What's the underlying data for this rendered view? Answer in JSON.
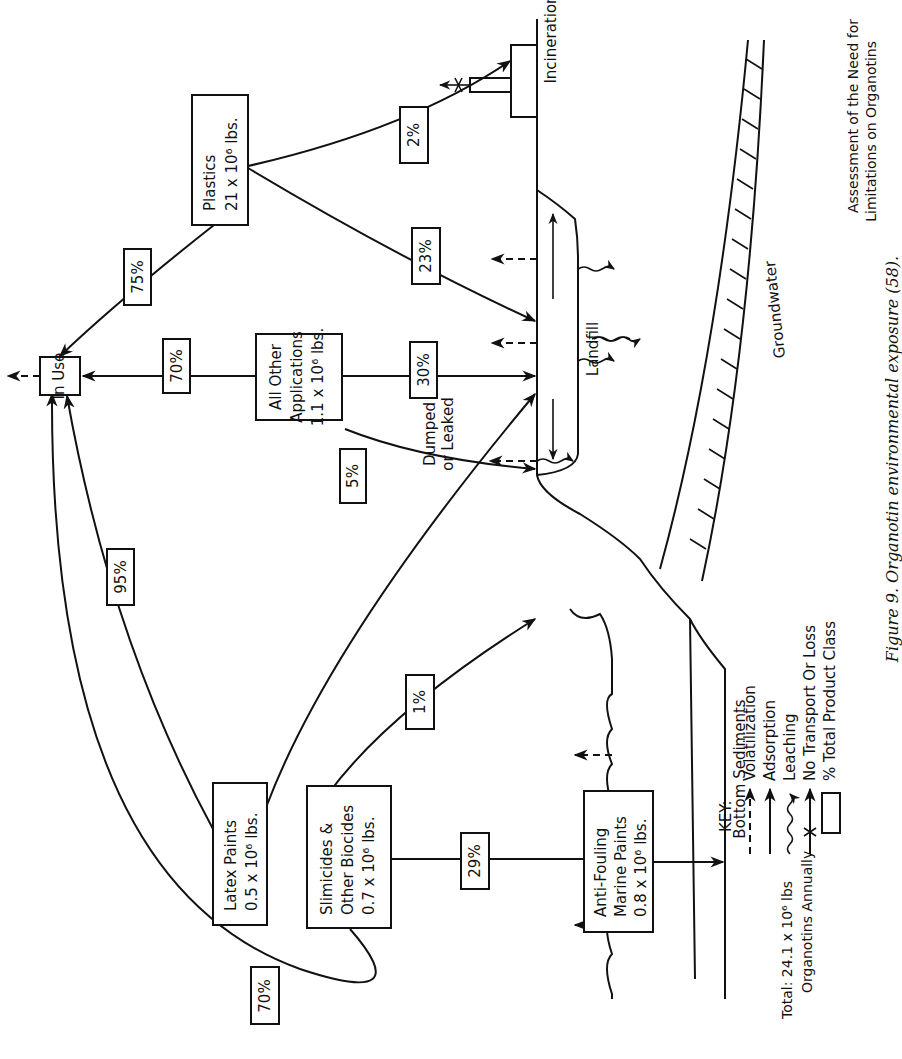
{
  "nodes": {
    "in_use": {
      "label": "In Use"
    },
    "plastics": {
      "line1": "Plastics",
      "line2": "21 x 10⁶ lbs."
    },
    "all_other": {
      "line1": "All Other",
      "line2": "Applications",
      "line3": "1.1 x 10⁶ lbs."
    },
    "latex": {
      "line1": "Latex Paints",
      "line2": "0.5 x 10⁶ lbs."
    },
    "slimicides": {
      "line1": "Slimicides &",
      "line2": "Other Biocides",
      "line3": "0.7 x 10⁶ lbs."
    },
    "antifouling": {
      "line1": "Anti-Fouling",
      "line2": "Marine Paints",
      "line3": "0.8 x 10⁶ lbs."
    }
  },
  "flows": {
    "plastics_to_in_use": "75%",
    "plastics_to_incineration": "2%",
    "plastics_to_landfill": "23%",
    "all_other_to_in_use": "70%",
    "all_other_to_landfill": "30%",
    "latex_to_in_use": "95%",
    "latex_to_dumped": "5%",
    "slimicides_to_in_use": "70%",
    "slimicides_to_dumped": "1%",
    "slimicides_to_water": "29%"
  },
  "places": {
    "incineration": "Incineration",
    "landfill": "Landfill",
    "groundwater": "Groundwater",
    "dumped_line1": "Dumped",
    "dumped_line2": "or Leaked",
    "bottom_sediments": "Bottom Sediments"
  },
  "key": {
    "title": "KEY:",
    "items": [
      {
        "icon": "dashed-arrow",
        "label": "Volatilization"
      },
      {
        "icon": "solid-arrow",
        "label": "Adsorption"
      },
      {
        "icon": "wavy-arrow",
        "label": "Leaching"
      },
      {
        "icon": "crossed-arrow",
        "label": "No Transport Or Loss"
      },
      {
        "icon": "box",
        "label": "% Total Product Class"
      }
    ]
  },
  "total": {
    "line1": "Total:  24.1 x 10⁶ lbs",
    "line2": "Organotins Annually"
  },
  "header": {
    "line1": "Assessment of the Need for",
    "line2": "Limitations on Organotins"
  },
  "caption": "Figure 9.   Organotin environmental exposure (58)."
}
